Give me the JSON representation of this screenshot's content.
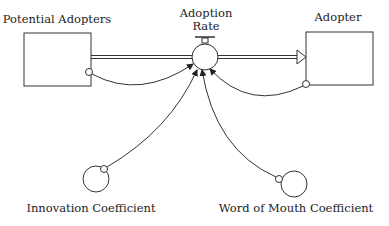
{
  "diagram": {
    "type": "stock-and-flow",
    "stocks": [
      {
        "id": "potential_adopters",
        "label": "Potential Adopters"
      },
      {
        "id": "adopter",
        "label": "Adopter"
      }
    ],
    "flows": [
      {
        "id": "adoption_rate",
        "label_line1": "Adoption",
        "label_line2": "Rate",
        "from": "potential_adopters",
        "to": "adopter"
      }
    ],
    "auxiliaries": [
      {
        "id": "innovation_coefficient",
        "label": "Innovation Coefficient"
      },
      {
        "id": "word_of_mouth_coefficient",
        "label": "Word of Mouth Coefficient"
      }
    ],
    "links": [
      {
        "from": "potential_adopters",
        "to": "adoption_rate"
      },
      {
        "from": "adopter",
        "to": "adoption_rate"
      },
      {
        "from": "innovation_coefficient",
        "to": "adoption_rate"
      },
      {
        "from": "word_of_mouth_coefficient",
        "to": "adoption_rate"
      }
    ],
    "colors": {
      "stroke": "#222222",
      "background": "#ffffff"
    }
  }
}
